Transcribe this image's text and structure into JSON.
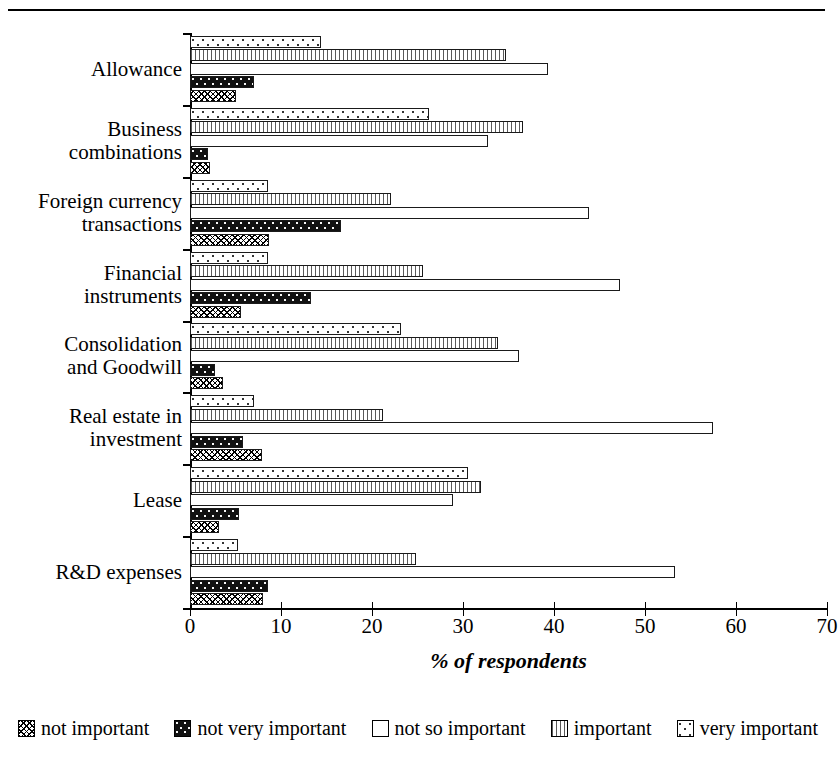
{
  "chart_data": {
    "type": "bar",
    "orientation": "horizontal",
    "title": "",
    "xlabel": "% of respondents",
    "ylabel": "",
    "xlim": [
      0,
      70
    ],
    "xticks": [
      0,
      10,
      20,
      30,
      40,
      50,
      60,
      70
    ],
    "xticklabels": [
      "0",
      "10",
      "20",
      "30",
      "40",
      "50",
      "60",
      "70"
    ],
    "grid": false,
    "legend_position": "bottom",
    "categories": [
      "Allowance",
      "Business combinations",
      "Foreign currency transactions",
      "Financial instruments",
      "Consolidation and Goodwill",
      "Real estate in investment",
      "Lease",
      "R&D expenses"
    ],
    "category_lines": [
      [
        "Allowance"
      ],
      [
        "Business",
        "combinations"
      ],
      [
        "Foreign currency",
        "transactions"
      ],
      [
        "Financial",
        "instruments"
      ],
      [
        "Consolidation",
        "and Goodwill"
      ],
      [
        "Real estate in",
        "investment"
      ],
      [
        "Lease"
      ],
      [
        "R&D expenses"
      ]
    ],
    "series": [
      {
        "name": "very important",
        "pattern": "pat-veryimportant",
        "values": [
          14.4,
          26.3,
          8.6,
          8.6,
          23.2,
          7.0,
          30.5,
          5.3
        ]
      },
      {
        "name": "important",
        "pattern": "pat-important",
        "values": [
          34.7,
          36.6,
          22.1,
          25.6,
          33.8,
          21.2,
          32.0,
          24.8
        ]
      },
      {
        "name": "not so important",
        "pattern": "pat-notsoimportant",
        "values": [
          39.3,
          32.7,
          43.9,
          47.3,
          36.2,
          57.5,
          28.9,
          53.3
        ]
      },
      {
        "name": "not very important",
        "pattern": "pat-notveryimportant",
        "values": [
          7.0,
          2.0,
          16.6,
          13.3,
          2.8,
          5.8,
          5.4,
          8.6
        ]
      },
      {
        "name": "not important",
        "pattern": "pat-notimportant",
        "values": [
          5.0,
          2.2,
          8.7,
          5.6,
          3.6,
          7.9,
          3.2,
          8.0
        ]
      }
    ],
    "legend": [
      {
        "label": "not important",
        "pattern": "pat-notimportant"
      },
      {
        "label": "not very important",
        "pattern": "pat-notveryimportant"
      },
      {
        "label": "not so important",
        "pattern": "pat-notsoimportant"
      },
      {
        "label": "important",
        "pattern": "pat-important"
      },
      {
        "label": "very important",
        "pattern": "pat-veryimportant"
      }
    ],
    "colors": {
      "axis": "#000000",
      "bar_outline": "#1a1a1a",
      "background": "#ffffff",
      "dark_fill": "#111111"
    }
  }
}
